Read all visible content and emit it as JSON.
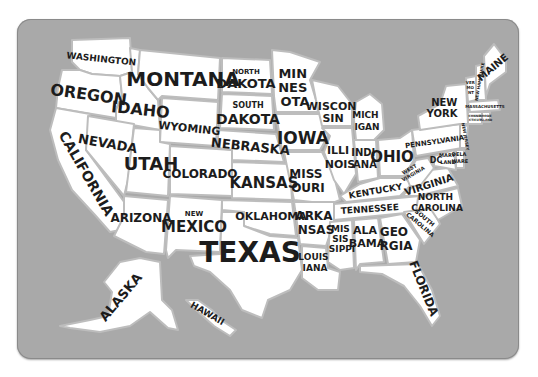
{
  "map": {
    "title": "USA States Map",
    "background_color": "#a9a9a9",
    "land_color": "#ffffff",
    "border_color": "#bdbdbd",
    "text_color": "#1c1c1c",
    "states": [
      {
        "id": "washington",
        "label": "WASHINGTON"
      },
      {
        "id": "oregon",
        "label": "OREGON"
      },
      {
        "id": "california",
        "label": "CALIFORNIA"
      },
      {
        "id": "idaho",
        "label": "IDAHO"
      },
      {
        "id": "nevada",
        "label": "NEVADA"
      },
      {
        "id": "montana",
        "label": "MONTANA"
      },
      {
        "id": "wyoming",
        "label": "WYOMING"
      },
      {
        "id": "utah",
        "label": "UTAH"
      },
      {
        "id": "arizona",
        "label": "ARIZONA"
      },
      {
        "id": "colorado",
        "label": "COLORADO"
      },
      {
        "id": "new_mexico",
        "label_top": "NEW",
        "label": "MEXICO"
      },
      {
        "id": "north_dakota",
        "label_top": "NORTH",
        "label": "DAKOTA"
      },
      {
        "id": "south_dakota",
        "label_top": "SOUTH",
        "label": "DAKOTA"
      },
      {
        "id": "nebraska",
        "label": "NEBRASKA"
      },
      {
        "id": "kansas",
        "label": "KANSAS"
      },
      {
        "id": "oklahoma",
        "label": "OKLAHOMA"
      },
      {
        "id": "texas",
        "label": "TEXAS"
      },
      {
        "id": "minnesota",
        "lines": [
          "MIN",
          "NES",
          "OTA"
        ]
      },
      {
        "id": "iowa",
        "label": "IOWA"
      },
      {
        "id": "missouri",
        "lines": [
          "MISS",
          "OURI"
        ]
      },
      {
        "id": "arkansas",
        "lines": [
          "ARKA",
          "NSAS"
        ]
      },
      {
        "id": "louisiana",
        "lines": [
          "LOUIS",
          "IANA"
        ]
      },
      {
        "id": "wisconsin",
        "lines": [
          "WISCON",
          "SIN"
        ]
      },
      {
        "id": "illinois",
        "lines": [
          "ILLI",
          "NOIS"
        ]
      },
      {
        "id": "michigan",
        "lines": [
          "MICH",
          "IGAN"
        ]
      },
      {
        "id": "indiana",
        "lines": [
          "INDI",
          "ANA"
        ]
      },
      {
        "id": "ohio",
        "label": "OHIO"
      },
      {
        "id": "kentucky",
        "label": "KENTUCKY"
      },
      {
        "id": "tennessee",
        "label": "TENNESSEE"
      },
      {
        "id": "mississippi",
        "lines": [
          "MIS",
          "SIS",
          "SIPPI"
        ]
      },
      {
        "id": "alabama",
        "lines": [
          "ALA",
          "BAMA"
        ]
      },
      {
        "id": "georgia",
        "lines": [
          "GEO",
          "RGIA"
        ]
      },
      {
        "id": "florida",
        "label": "FLORIDA"
      },
      {
        "id": "south_carolina",
        "lines": [
          "SOUTH",
          "CAROLINA"
        ]
      },
      {
        "id": "north_carolina",
        "lines": [
          "NORTH",
          "CAROLINA"
        ]
      },
      {
        "id": "virginia",
        "label": "VIRGINIA"
      },
      {
        "id": "west_virginia",
        "lines": [
          "WEST",
          "VIRGINIA"
        ]
      },
      {
        "id": "dc",
        "label": "DC"
      },
      {
        "id": "maryland",
        "lines": [
          "MARY",
          "LAND"
        ]
      },
      {
        "id": "delaware",
        "lines": [
          "DELA",
          "WARE"
        ]
      },
      {
        "id": "pennsylvania",
        "label": "PENNSYLVANIA"
      },
      {
        "id": "new_jersey",
        "label": "NEW JERSEY"
      },
      {
        "id": "new_york",
        "lines": [
          "NEW",
          "YORK"
        ]
      },
      {
        "id": "vermont",
        "lines": [
          "VER",
          "MO",
          "NT"
        ]
      },
      {
        "id": "new_hampshire",
        "label": "NEW HAMPSHIRE"
      },
      {
        "id": "maine",
        "label": "MAINE"
      },
      {
        "id": "massachusetts",
        "label": "MASSACHUSETTS"
      },
      {
        "id": "connecticut",
        "lines": [
          "CONNE",
          "CTICUT"
        ]
      },
      {
        "id": "rhode_island",
        "lines": [
          "RHODE",
          "ISLAND"
        ]
      },
      {
        "id": "alaska",
        "label": "ALASKA"
      },
      {
        "id": "hawaii",
        "label": "HAWAII"
      }
    ]
  }
}
